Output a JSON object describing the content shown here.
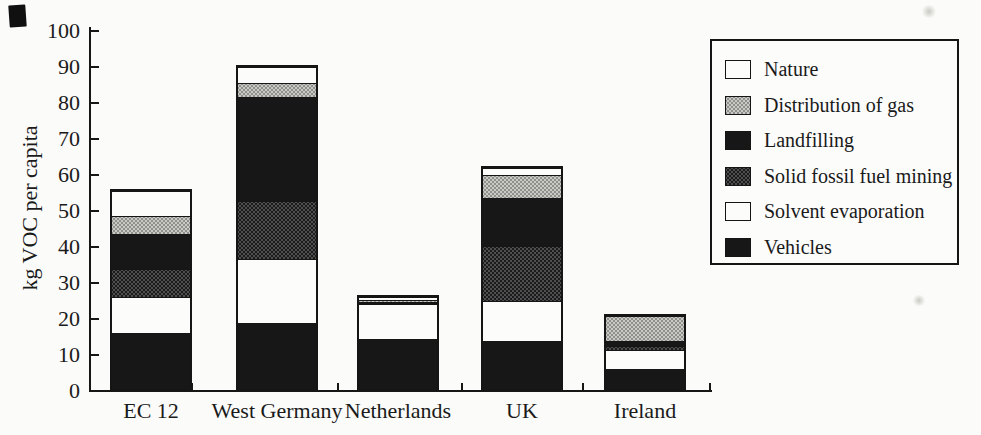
{
  "figure": {
    "kind": "scanned stacked bar chart",
    "y_axis_title": "kg VOC per capita"
  },
  "chart_data": {
    "type": "bar",
    "stacked": true,
    "title": "",
    "xlabel": "",
    "ylabel": "kg VOC per capita",
    "ylim": [
      0,
      100
    ],
    "ytick_interval": 10,
    "ytick_labels": [
      "0",
      "10",
      "20",
      "30",
      "40",
      "50",
      "60",
      "70",
      "80",
      "90",
      "100"
    ],
    "grid": false,
    "categories": [
      "EC 12",
      "West Germany",
      "Netherlands",
      "UK",
      "Ireland"
    ],
    "series_note": "series listed bottom-to-top in stacking order; values in kg VOC per capita (estimated from axis)",
    "series": [
      {
        "name": "Vehicles",
        "pattern": "solid-black",
        "values": [
          16,
          18.5,
          14.5,
          13.5,
          6
        ]
      },
      {
        "name": "Solvent evaporation",
        "pattern": "white",
        "values": [
          10,
          18,
          10,
          11.5,
          5.5
        ]
      },
      {
        "name": "Solid fossil fuel mining",
        "pattern": "dark-dots",
        "values": [
          8,
          16.5,
          0.3,
          15.5,
          1
        ]
      },
      {
        "name": "Landfilling",
        "pattern": "solid-black",
        "values": [
          10,
          29,
          0.4,
          13.5,
          1.5
        ]
      },
      {
        "name": "Distribution of gas",
        "pattern": "light-dots",
        "values": [
          5,
          4,
          0.6,
          6.5,
          7.5
        ]
      },
      {
        "name": "Nature",
        "pattern": "white",
        "values": [
          7,
          4.5,
          0.8,
          2,
          0
        ]
      }
    ],
    "totals_approx": [
      56,
      90.5,
      26.6,
      62.5,
      21.5
    ],
    "legend": {
      "position": "top-right",
      "items_top_to_bottom": [
        "Nature",
        "Distribution of gas",
        "Landfilling",
        "Solid fossil fuel mining",
        "Solvent evaporation",
        "Vehicles"
      ]
    }
  },
  "style": {
    "paper": "#fbfbf9",
    "ink": "#161616",
    "black_fill": "#171717",
    "dark_gray_fill": "#3f3f3f",
    "light_gray_fill": "#b5b5b2",
    "white_fill": "#fcfcfa"
  }
}
